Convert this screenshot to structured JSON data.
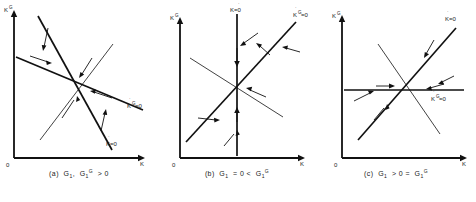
{
  "figure": {
    "background": "#ffffff",
    "ink": "#111111"
  },
  "panels": [
    {
      "id": "a",
      "caption": "(a)  G",
      "caption_full": "(a)  G1 , G1' > 0",
      "caption_parts": {
        "prefix": "(a)",
        "first_symbol": "G",
        "first_sub": "1",
        "separator": ",",
        "second_symbol": "G",
        "second_sub": "1",
        "second_sup": "G",
        "relation": "> 0"
      },
      "axes": {
        "y_label": "K",
        "y_label_sup": "G",
        "x_label": "K",
        "origin_label": "0"
      },
      "curves": [
        {
          "name": "kdot-zero",
          "label": "K=0",
          "label_dot": "·",
          "slope": "steep-down"
        },
        {
          "name": "kgdot-zero",
          "label": "K",
          "label_sup": "G",
          "label_eq": "=0",
          "slope": "shallow-down"
        },
        {
          "name": "saddle-path",
          "label": "",
          "slope": "up"
        }
      ]
    },
    {
      "id": "b",
      "caption_full": "(b)  G1 = 0 < G1'",
      "caption_parts": {
        "prefix": "(b)",
        "first_symbol": "G",
        "first_sub": "1",
        "relation1": "= 0 <",
        "second_symbol": "G",
        "second_sub": "1",
        "second_sup": "G"
      },
      "axes": {
        "y_label": "K",
        "y_label_sup": "G",
        "x_label": "K",
        "origin_label": "0"
      },
      "curves": [
        {
          "name": "kdot-zero",
          "label": "K=0",
          "slope": "vertical"
        },
        {
          "name": "kgdot-zero",
          "label": "K",
          "label_sup": "G",
          "label_eq": "=0",
          "slope": "up"
        },
        {
          "name": "saddle-path",
          "label": "",
          "slope": "down"
        }
      ]
    },
    {
      "id": "c",
      "caption_full": "(c)  G1 > 0 = G1'",
      "caption_parts": {
        "prefix": "(c)",
        "first_symbol": "G",
        "first_sub": "1",
        "relation1": "> 0 =",
        "second_symbol": "G",
        "second_sub": "1",
        "second_sup": "G"
      },
      "axes": {
        "y_label": "K",
        "y_label_sup": "G",
        "x_label": "K",
        "origin_label": "0"
      },
      "curves": [
        {
          "name": "kdot-zero",
          "label": "K=0",
          "slope": "up"
        },
        {
          "name": "kgdot-zero",
          "label": "K",
          "label_sup": "G",
          "label_eq": "=0",
          "slope": "horizontal"
        },
        {
          "name": "saddle-path",
          "label": "",
          "slope": "down"
        }
      ]
    }
  ],
  "labels": {
    "kdot_eq": "=0",
    "k": "K",
    "g": "G",
    "dot": "·",
    "zero": "0"
  }
}
